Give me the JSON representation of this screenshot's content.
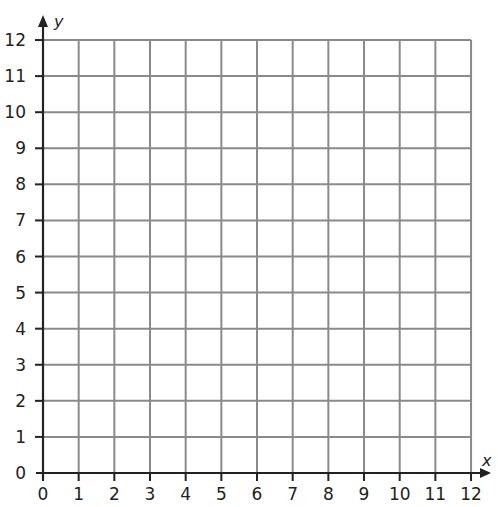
{
  "chart_data": {
    "type": "coordinate-grid",
    "title": "",
    "xlabel": "x",
    "ylabel": "y",
    "xlim": [
      0,
      12
    ],
    "ylim": [
      0,
      12
    ],
    "grid": true,
    "x_ticks": [
      "0",
      "1",
      "2",
      "3",
      "4",
      "5",
      "6",
      "7",
      "8",
      "9",
      "10",
      "11",
      "12"
    ],
    "y_ticks": [
      "0",
      "1",
      "2",
      "3",
      "4",
      "5",
      "6",
      "7",
      "8",
      "9",
      "10",
      "11",
      "12"
    ],
    "points": []
  },
  "colors": {
    "grid": "#8a8a8a",
    "axis": "#222222",
    "background": "#ffffff"
  },
  "layout": {
    "origin_x": 43,
    "origin_y": 473,
    "unit_x": 35.67,
    "unit_y": 36.08
  }
}
